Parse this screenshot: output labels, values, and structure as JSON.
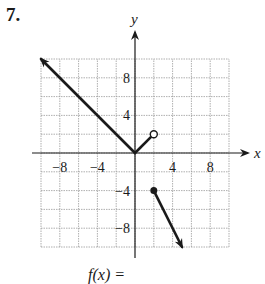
{
  "problem": {
    "number": "7."
  },
  "chart_data": {
    "type": "line",
    "title": "",
    "xlabel": "x",
    "ylabel": "y",
    "xlim": [
      -10,
      10
    ],
    "ylim": [
      -10,
      10
    ],
    "grid": true,
    "grid_step": 2,
    "x_ticks": [
      -8,
      -4,
      4,
      8
    ],
    "y_ticks": [
      8,
      4,
      -4,
      -8
    ],
    "x_tick_labels": [
      "−8",
      "−4",
      "4",
      "8"
    ],
    "y_tick_labels": [
      "8",
      "4",
      "−4",
      "−8"
    ],
    "series": [
      {
        "name": "ray-left",
        "points": [
          [
            0,
            0
          ],
          [
            -10,
            10
          ]
        ],
        "arrow_end": true,
        "start_marker": "none"
      },
      {
        "name": "segment-middle",
        "points": [
          [
            0,
            0
          ],
          [
            2,
            2
          ]
        ],
        "end_marker": "open"
      },
      {
        "name": "ray-right",
        "points": [
          [
            2,
            -4
          ],
          [
            5,
            -10
          ]
        ],
        "start_marker": "closed",
        "arrow_end": true
      }
    ]
  },
  "caption": {
    "text": "f(x) ="
  }
}
